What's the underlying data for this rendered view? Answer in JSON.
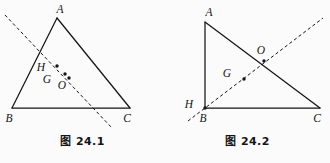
{
  "document": {
    "kind": "geometry-figure-pair",
    "background_color": "#fbfbfb",
    "ink_color": "#141414"
  },
  "figures": [
    {
      "id": "fig-24-1",
      "caption_prefix": "图",
      "caption_number": "24.1",
      "caption_full": "图 24.1",
      "shape": "acute triangle ABC with Euler line",
      "vertices": [
        {
          "name": "A",
          "label": "A",
          "x": 57,
          "y": 18,
          "label_x": 60,
          "label_y": 13
        },
        {
          "name": "B",
          "label": "B",
          "x": 12,
          "y": 108,
          "label_x": 9,
          "label_y": 122
        },
        {
          "name": "C",
          "label": "C",
          "x": 130,
          "y": 108,
          "label_x": 127,
          "label_y": 122
        }
      ],
      "points": [
        {
          "name": "H",
          "label": "H",
          "x": 57,
          "y": 66,
          "label_x": 41,
          "label_y": 71,
          "dot": true
        },
        {
          "name": "G",
          "label": "G",
          "x": 65,
          "y": 74,
          "label_x": 47,
          "label_y": 83,
          "dot": true
        },
        {
          "name": "O",
          "label": "O",
          "x": 69,
          "y": 78,
          "label_x": 62,
          "label_y": 89,
          "dot": true
        }
      ],
      "dashed_line": {
        "name": "euler-line",
        "x1": 5,
        "y1": 15,
        "x2": 112,
        "y2": 128
      },
      "solid_edges": [
        {
          "name": "edge-AB",
          "x1": 57,
          "y1": 18,
          "x2": 12,
          "y2": 108
        },
        {
          "name": "edge-AC",
          "x1": 57,
          "y1": 18,
          "x2": 130,
          "y2": 108
        },
        {
          "name": "edge-BC",
          "x1": 12,
          "y1": 108,
          "x2": 130,
          "y2": 108
        }
      ]
    },
    {
      "id": "fig-24-2",
      "caption_prefix": "图",
      "caption_number": "24.2",
      "caption_full": "图 24.2",
      "shape": "right triangle ABC with Euler line through B",
      "vertices": [
        {
          "name": "A",
          "label": "A",
          "x": 40,
          "y": 22,
          "label_x": 44,
          "label_y": 16
        },
        {
          "name": "B",
          "label": "B",
          "x": 40,
          "y": 108,
          "label_x": 38,
          "label_y": 122
        },
        {
          "name": "C",
          "label": "C",
          "x": 155,
          "y": 108,
          "label_x": 152,
          "label_y": 122
        }
      ],
      "points": [
        {
          "name": "H",
          "label": "H",
          "x": 40,
          "y": 108,
          "label_x": 24,
          "label_y": 108,
          "dot": true
        },
        {
          "name": "G",
          "label": "G",
          "x": 79,
          "y": 79,
          "label_x": 62,
          "label_y": 77,
          "dot": true
        },
        {
          "name": "O",
          "label": "O",
          "x": 99,
          "y": 61,
          "label_x": 96,
          "label_y": 54,
          "dot": true
        }
      ],
      "dashed_line": {
        "name": "euler-line",
        "x1": 23,
        "y1": 121,
        "x2": 158,
        "y2": 18
      },
      "solid_edges": [
        {
          "name": "edge-AB",
          "x1": 40,
          "y1": 22,
          "x2": 40,
          "y2": 108
        },
        {
          "name": "edge-AC",
          "x1": 40,
          "y1": 22,
          "x2": 155,
          "y2": 108
        },
        {
          "name": "edge-BC",
          "x1": 40,
          "y1": 108,
          "x2": 155,
          "y2": 108
        }
      ]
    }
  ]
}
